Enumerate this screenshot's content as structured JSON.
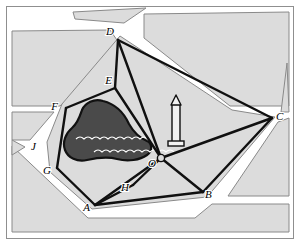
{
  "figure": {
    "width": 300,
    "height": 245,
    "border_color": "#8f8f8f"
  },
  "colors": {
    "background": "#ffffff",
    "block_fill": "#dcdcdc",
    "block_stroke": "#8a8a8a",
    "road_fill": "#ffffff",
    "survey_line": "#101010",
    "lake_fill": "#4a4a4a",
    "lake_stroke": "#111111",
    "wave_mark": "#ffffff",
    "monument_body": "#f2f2f2",
    "monument_stroke": "#111111",
    "label_text": "#000000"
  },
  "points": [
    {
      "id": "A",
      "label": "A",
      "x": 95,
      "y": 205,
      "label_x": 90,
      "label_y": 211
    },
    {
      "id": "B",
      "label": "B",
      "x": 203,
      "y": 192,
      "label_x": 205,
      "label_y": 198
    },
    {
      "id": "C",
      "label": "C",
      "x": 272,
      "y": 118,
      "label_x": 276,
      "label_y": 120
    },
    {
      "id": "D",
      "label": "D",
      "x": 118,
      "y": 40,
      "label_x": 114,
      "label_y": 35
    },
    {
      "id": "E",
      "label": "E",
      "x": 115,
      "y": 88,
      "label_x": 112,
      "label_y": 84
    },
    {
      "id": "F",
      "label": "F",
      "x": 66,
      "y": 108,
      "label_x": 58,
      "label_y": 110
    },
    {
      "id": "G",
      "label": "G",
      "x": 57,
      "y": 168,
      "label_x": 51,
      "label_y": 174
    },
    {
      "id": "H",
      "label": "H",
      "x": 133,
      "y": 185,
      "label_x": 129,
      "label_y": 191
    },
    {
      "id": "J",
      "label": "J",
      "x": 36,
      "y": 146,
      "label_x": 31,
      "label_y": 150
    },
    {
      "id": "O",
      "label": "O",
      "x": 161,
      "y": 158,
      "label_x": 156,
      "label_y": 166
    }
  ],
  "survey_lines": [
    {
      "from": "D",
      "to": "E"
    },
    {
      "from": "D",
      "to": "O"
    },
    {
      "from": "D",
      "to": "C"
    },
    {
      "from": "E",
      "to": "F"
    },
    {
      "from": "E",
      "to": "O"
    },
    {
      "from": "F",
      "to": "G"
    },
    {
      "from": "G",
      "to": "A"
    },
    {
      "from": "A",
      "to": "H"
    },
    {
      "from": "A",
      "to": "B"
    },
    {
      "from": "A",
      "to": "O"
    },
    {
      "from": "H",
      "to": "O"
    },
    {
      "from": "B",
      "to": "O"
    },
    {
      "from": "B",
      "to": "C"
    },
    {
      "from": "C",
      "to": "O"
    }
  ],
  "lake": {
    "name": "lake",
    "wave_rows": [
      {
        "y": 139,
        "x_start": 76,
        "count": 9,
        "step": 8
      },
      {
        "y": 152,
        "x_start": 94,
        "count": 10,
        "step": 8
      }
    ]
  },
  "monument": {
    "name": "obelisk-monument",
    "x": 176,
    "base_y": 146,
    "top_y": 96
  },
  "city_blocks": [
    {
      "name": "block-top-sliver"
    },
    {
      "name": "block-northwest"
    },
    {
      "name": "block-northeast"
    },
    {
      "name": "block-east"
    },
    {
      "name": "block-southeast"
    },
    {
      "name": "block-south"
    },
    {
      "name": "block-west-wedge"
    },
    {
      "name": "block-west-small-triangle"
    },
    {
      "name": "block-central-park"
    }
  ]
}
